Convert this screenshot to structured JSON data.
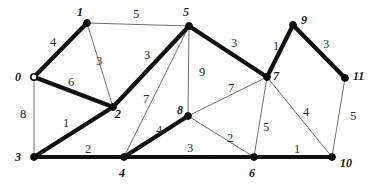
{
  "figure": {
    "type": "undirected-weighted-graph",
    "background_color": "#ffffff",
    "thin_edge_color": "#6f6f6f",
    "thick_edge_color": "#111111",
    "node_fill_color": "#0b0b0b",
    "open_node_fill_color": "#ffffff"
  },
  "chart_data": {
    "type": "diagram",
    "title": "",
    "nodes": [
      {
        "id": "n0",
        "label": "0",
        "x": 34,
        "y": 77,
        "style": "open",
        "label_x": 15,
        "label_y": 71
      },
      {
        "id": "n1",
        "label": "1",
        "x": 87,
        "y": 23,
        "style": "filled",
        "label_x": 77,
        "label_y": 6
      },
      {
        "id": "n2",
        "label": "2",
        "x": 113,
        "y": 107,
        "style": "filled",
        "label_x": 115,
        "label_y": 108
      },
      {
        "id": "n3",
        "label": "3",
        "x": 34,
        "y": 157,
        "style": "filled",
        "label_x": 15,
        "label_y": 151
      },
      {
        "id": "n4",
        "label": "4",
        "x": 124,
        "y": 157,
        "style": "filled",
        "label_x": 119,
        "label_y": 167
      },
      {
        "id": "n5",
        "label": "5",
        "x": 189,
        "y": 26,
        "style": "filled",
        "label_x": 183,
        "label_y": 6
      },
      {
        "id": "n6",
        "label": "6",
        "x": 254,
        "y": 157,
        "style": "filled",
        "label_x": 249,
        "label_y": 167
      },
      {
        "id": "n7",
        "label": "7",
        "x": 267,
        "y": 77,
        "style": "filled",
        "label_x": 273,
        "label_y": 70
      },
      {
        "id": "n8",
        "label": "8",
        "x": 188,
        "y": 116,
        "style": "filled",
        "label_x": 177,
        "label_y": 104
      },
      {
        "id": "n9",
        "label": "9",
        "x": 293,
        "y": 25,
        "style": "filled",
        "label_x": 301,
        "label_y": 14
      },
      {
        "id": "n10",
        "label": "10",
        "x": 332,
        "y": 157,
        "style": "filled",
        "label_x": 340,
        "label_y": 157
      },
      {
        "id": "n11",
        "label": "11",
        "x": 345,
        "y": 78,
        "style": "filled",
        "label_x": 353,
        "label_y": 70
      }
    ],
    "edges": [
      {
        "from": "n0",
        "to": "n1",
        "weight": "4",
        "bold": true,
        "label_x": 50,
        "label_y": 36
      },
      {
        "from": "n0",
        "to": "n2",
        "weight": "6",
        "bold": true,
        "label_x": 68,
        "label_y": 76
      },
      {
        "from": "n0",
        "to": "n3",
        "weight": "8",
        "bold": false,
        "label_x": 20,
        "label_y": 108
      },
      {
        "from": "n1",
        "to": "n2",
        "weight": "3",
        "bold": false,
        "label_x": 96,
        "label_y": 55
      },
      {
        "from": "n1",
        "to": "n5",
        "weight": "5",
        "bold": false,
        "label_x": 133,
        "label_y": 8
      },
      {
        "from": "n2",
        "to": "n3",
        "weight": "1",
        "bold": true,
        "label_x": 63,
        "label_y": 117
      },
      {
        "from": "n2",
        "to": "n5",
        "weight": "3",
        "bold": true,
        "label_x": 144,
        "label_y": 49
      },
      {
        "from": "n3",
        "to": "n4",
        "weight": "2",
        "bold": true,
        "label_x": 85,
        "label_y": 143
      },
      {
        "from": "n4",
        "to": "n5",
        "weight": "7",
        "bold": false,
        "label_x": 143,
        "label_y": 93
      },
      {
        "from": "n4",
        "to": "n8",
        "weight": "4",
        "bold": true,
        "label_x": 156,
        "label_y": 124
      },
      {
        "from": "n4",
        "to": "n6",
        "weight": "3",
        "bold": true,
        "label_x": 187,
        "label_y": 142
      },
      {
        "from": "n5",
        "to": "n8",
        "weight": "9",
        "bold": false,
        "label_x": 199,
        "label_y": 66
      },
      {
        "from": "n5",
        "to": "n7",
        "weight": "3",
        "bold": true,
        "label_x": 231,
        "label_y": 37
      },
      {
        "from": "n7",
        "to": "n8",
        "weight": "7",
        "bold": false,
        "label_x": 228,
        "label_y": 82
      },
      {
        "from": "n7",
        "to": "n9",
        "weight": "1",
        "bold": true,
        "label_x": 273,
        "label_y": 40
      },
      {
        "from": "n7",
        "to": "n6",
        "weight": "5",
        "bold": false,
        "label_x": 263,
        "label_y": 121
      },
      {
        "from": "n7",
        "to": "n10",
        "weight": "4",
        "bold": false,
        "label_x": 303,
        "label_y": 106
      },
      {
        "from": "n8",
        "to": "n6",
        "weight": "2",
        "bold": false,
        "label_x": 227,
        "label_y": 132
      },
      {
        "from": "n9",
        "to": "n11",
        "weight": "3",
        "bold": true,
        "label_x": 323,
        "label_y": 38
      },
      {
        "from": "n6",
        "to": "n10",
        "weight": "1",
        "bold": true,
        "label_x": 294,
        "label_y": 143
      },
      {
        "from": "n11",
        "to": "n10",
        "weight": "5",
        "bold": false,
        "label_x": 350,
        "label_y": 110
      }
    ]
  }
}
